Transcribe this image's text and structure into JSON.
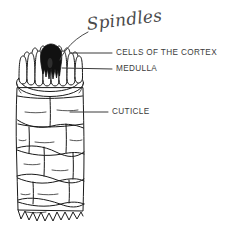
{
  "figure": {
    "kind": "hand-drawn-biological-diagram",
    "background_color": "#ffffff",
    "ink_color": "#1a1a1a",
    "medulla_color": "#111111",
    "label_text_color": "#3b3b3b",
    "leader_color": "#3a3a3a"
  },
  "labels": {
    "spindles": {
      "text": "Spindles",
      "style": "handwritten",
      "points_to": "cortex-spindle-cells"
    },
    "cells_of_the_cortex": {
      "text": "CELLS OF THE CORTEX",
      "style": "printed-uppercase",
      "points_to": "cortex-spindle-cells"
    },
    "medulla": {
      "text": "MEDULLA",
      "style": "printed-uppercase",
      "points_to": "medulla-core"
    },
    "cuticle": {
      "text": "CUTICLE",
      "style": "printed-uppercase",
      "points_to": "cuticle-scales"
    }
  },
  "structures": [
    {
      "name": "cortex-spindle-cells",
      "description": "ring of vertical rounded spindle-shaped cells at the cut top"
    },
    {
      "name": "medulla-core",
      "description": "solid black irregular central core"
    },
    {
      "name": "cuticle-rim",
      "description": "double-line ellipse at the cut top edge"
    },
    {
      "name": "cuticle-scales",
      "description": "staggered overlapping scales along the shaft"
    },
    {
      "name": "torn-bottom-edge",
      "description": "jagged zigzag bottom edge"
    }
  ]
}
